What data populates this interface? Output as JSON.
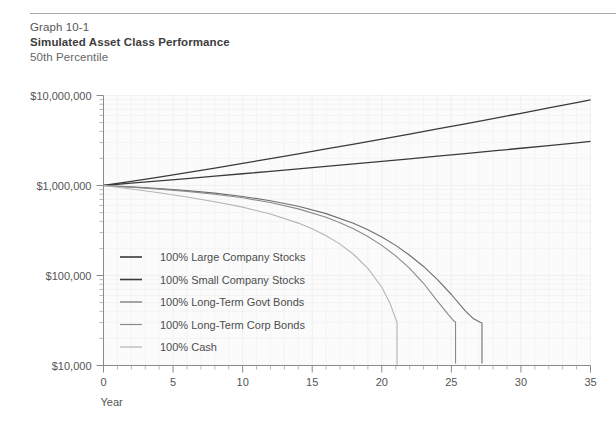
{
  "header": {
    "graph_number": "Graph 10-1",
    "title": "Simulated Asset Class Performance",
    "subtitle": "50th Percentile"
  },
  "chart_data": {
    "type": "line",
    "title": "Simulated Asset Class Performance",
    "subtitle": "50th Percentile",
    "xlabel": "Year",
    "ylabel": "",
    "yscale": "log",
    "ylim": [
      10000,
      10000000
    ],
    "xlim": [
      0,
      35
    ],
    "grid": true,
    "legend_position": "inside-lower-left",
    "y_tick_labels": [
      "$10,000,000",
      "$1,000,000",
      "$100,000",
      "$10,000"
    ],
    "y_tick_values": [
      10000000,
      1000000,
      100000,
      10000
    ],
    "x_tick_labels": [
      "0",
      "5",
      "10",
      "15",
      "20",
      "25",
      "30",
      "35"
    ],
    "x_tick_values": [
      0,
      5,
      10,
      15,
      20,
      25,
      30,
      35
    ],
    "x_minor_tick_step": 1,
    "series": [
      {
        "name": "100% Large Company Stocks",
        "color": "#3a3a3a",
        "width": 1.3,
        "x": [
          0,
          2,
          4,
          6,
          8,
          10,
          12,
          14,
          16,
          18,
          20,
          22,
          24,
          26,
          28,
          30,
          32,
          34,
          35
        ],
        "values": [
          1000000,
          1110000,
          1240000,
          1390000,
          1560000,
          1760000,
          1990000,
          2250000,
          2550000,
          2890000,
          3280000,
          3730000,
          4250000,
          4850000,
          5540000,
          6340000,
          7270000,
          8340000,
          8950000
        ]
      },
      {
        "name": "100% Small Company Stocks",
        "color": "#3a3a3a",
        "width": 1.3,
        "x": [
          0,
          2,
          4,
          6,
          8,
          10,
          12,
          14,
          16,
          18,
          20,
          22,
          24,
          26,
          28,
          30,
          32,
          34,
          35
        ],
        "values": [
          1000000,
          1060000,
          1125000,
          1195000,
          1270000,
          1350000,
          1437000,
          1530000,
          1630000,
          1738000,
          1855000,
          1980000,
          2115000,
          2262000,
          2420000,
          2592000,
          2778000,
          2980000,
          3090000
        ]
      },
      {
        "name": "100% Long-Term Govt Bonds",
        "color": "#6e6e6e",
        "width": 1.1,
        "x": [
          0,
          2,
          4,
          6,
          8,
          10,
          12,
          14,
          16,
          18,
          19,
          20,
          21,
          22,
          23,
          24,
          25,
          26,
          26.6,
          27.1,
          27.2,
          27.2
        ],
        "values": [
          1000000,
          965000,
          925000,
          878000,
          822000,
          756000,
          678000,
          588000,
          487000,
          378000,
          322000,
          268000,
          216000,
          168000,
          126000,
          90000,
          61500,
          40500,
          33000,
          30000,
          29800,
          10500
        ]
      },
      {
        "name": "100% Long-Term Corp Bonds",
        "color": "#8a8a8a",
        "width": 1.1,
        "x": [
          0,
          2,
          4,
          6,
          8,
          10,
          12,
          14,
          16,
          17,
          18,
          19,
          20,
          21,
          22,
          23,
          24,
          24.8,
          25.2,
          25.3,
          25.3
        ],
        "values": [
          1000000,
          958000,
          912000,
          860000,
          800000,
          730000,
          646000,
          550000,
          443000,
          386000,
          328000,
          271000,
          216000,
          165000,
          120000,
          82000,
          52000,
          36500,
          31000,
          30500,
          10500
        ]
      },
      {
        "name": "100% Cash",
        "color": "#b4b4b4",
        "width": 1.1,
        "x": [
          0,
          2,
          4,
          6,
          8,
          10,
          12,
          14,
          15,
          16,
          17,
          18,
          19,
          20,
          20.6,
          21.0,
          21.1,
          21.1
        ],
        "values": [
          1000000,
          915000,
          830000,
          745000,
          660000,
          575000,
          482000,
          382000,
          330000,
          277000,
          223000,
          170000,
          120000,
          74000,
          49000,
          33000,
          30500,
          9800
        ]
      }
    ],
    "legend": [
      {
        "label": "100% Large Company Stocks",
        "color": "#3a3a3a",
        "width": 1.6
      },
      {
        "label": "100% Small Company Stocks",
        "color": "#3a3a3a",
        "width": 1.6
      },
      {
        "label": "100% Long-Term Govt Bonds",
        "color": "#6e6e6e",
        "width": 1.2
      },
      {
        "label": "100% Long-Term Corp Bonds",
        "color": "#8a8a8a",
        "width": 1.2
      },
      {
        "label": "100% Cash",
        "color": "#b4b4b4",
        "width": 1.2
      }
    ]
  }
}
